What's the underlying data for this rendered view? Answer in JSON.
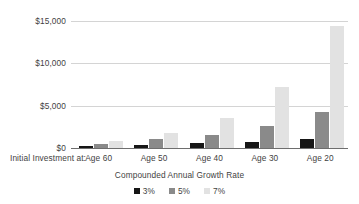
{
  "chart_data": {
    "type": "bar",
    "title": "",
    "xlabel": "Compounded Annual Growth Rate",
    "ylabel": "",
    "category_prefix": "Initial Investment at:",
    "categories": [
      "Age 60",
      "Age 50",
      "Age 40",
      "Age 30",
      "Age 20"
    ],
    "series": [
      {
        "name": "3%",
        "color": "#161616",
        "values": [
          210,
          400,
          540,
          760,
          1010
        ]
      },
      {
        "name": "5%",
        "color": "#8a8a8a",
        "values": [
          480,
          1010,
          1520,
          2600,
          4300
        ]
      },
      {
        "name": "7%",
        "color": "#e2e2e2",
        "values": [
          840,
          1800,
          3500,
          7250,
          14400
        ]
      }
    ],
    "ylim": [
      0,
      15000
    ],
    "y_ticks": [
      0,
      5000,
      10000,
      15000
    ],
    "y_tick_labels": [
      "$0",
      "$5,000",
      "$10,000",
      "$15,000"
    ],
    "grid": true,
    "legend_position": "bottom",
    "legend_entries": [
      "3%",
      "5%",
      "7%"
    ],
    "axis_color": "#6e6e6e",
    "gridline_color": "#d4d4d4",
    "text_color": "#3f3f3f",
    "background": "#ffffff"
  }
}
